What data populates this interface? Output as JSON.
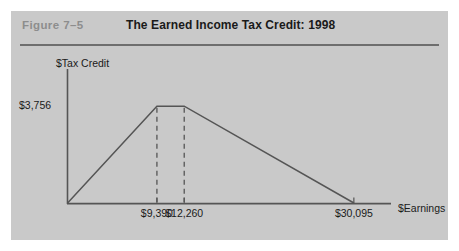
{
  "figure": {
    "number_label": "Figure  7–5",
    "title": "The Earned Income Tax Credit: 1998",
    "panel_color": "#c9c9c9",
    "rule_color": "#6e6e6e",
    "number_color": "#8d8d8d",
    "line_color": "#555555"
  },
  "chart_data": {
    "type": "line",
    "title": "The Earned Income Tax Credit: 1998",
    "xlabel": "$Earnings",
    "ylabel": "$Tax Credit",
    "grid": false,
    "legend": false,
    "x_tick_labels": [
      "$9,390",
      "$12,260",
      "$30,095"
    ],
    "x_tick_values": [
      9390,
      12260,
      30095
    ],
    "y_tick_labels": [
      "$3,756"
    ],
    "y_tick_values": [
      3756
    ],
    "xlim": [
      0,
      34000
    ],
    "ylim": [
      0,
      5200
    ],
    "series": [
      {
        "name": "Earned Income Tax Credit schedule",
        "x": [
          0,
          9390,
          12260,
          30095
        ],
        "values": [
          0,
          3756,
          3756,
          0
        ]
      }
    ],
    "annotations": [
      {
        "type": "dashed-vertical",
        "x": 9390,
        "from_y": 0,
        "to_y": 3756,
        "label": "$9,390"
      },
      {
        "type": "dashed-vertical",
        "x": 12260,
        "from_y": 0,
        "to_y": 3756,
        "label": "$12,260"
      }
    ]
  },
  "axes": {
    "y_title": "$Tax Credit",
    "x_title": "$Earnings",
    "y_tick_0": "$3,756",
    "x_tick_0": "$9,390",
    "x_tick_1": "$12,260",
    "x_tick_2": "$30,095"
  }
}
